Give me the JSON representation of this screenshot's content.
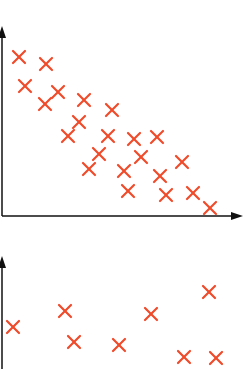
{
  "colors": {
    "marker": "#ef4a2a",
    "axis": "#111111",
    "background": "#ffffff"
  },
  "chart_data": [
    {
      "type": "scatter",
      "title": "",
      "xlabel": "",
      "ylabel": "",
      "grid": false,
      "legend": null,
      "marker": "x",
      "description": "Negative correlation scatter plot",
      "pixel_frame": {
        "x0": 2,
        "y0": 216,
        "x_end": 240,
        "y_top": 30
      },
      "points": [
        {
          "x": 19,
          "y": 57
        },
        {
          "x": 46,
          "y": 64
        },
        {
          "x": 25,
          "y": 86
        },
        {
          "x": 58,
          "y": 92
        },
        {
          "x": 45,
          "y": 104
        },
        {
          "x": 84,
          "y": 100
        },
        {
          "x": 112,
          "y": 110
        },
        {
          "x": 79,
          "y": 122
        },
        {
          "x": 68,
          "y": 136
        },
        {
          "x": 108,
          "y": 136
        },
        {
          "x": 134,
          "y": 139
        },
        {
          "x": 157,
          "y": 137
        },
        {
          "x": 99,
          "y": 154
        },
        {
          "x": 141,
          "y": 157
        },
        {
          "x": 89,
          "y": 169
        },
        {
          "x": 124,
          "y": 171
        },
        {
          "x": 160,
          "y": 176
        },
        {
          "x": 182,
          "y": 162
        },
        {
          "x": 128,
          "y": 191
        },
        {
          "x": 166,
          "y": 195
        },
        {
          "x": 193,
          "y": 193
        },
        {
          "x": 210,
          "y": 208
        }
      ]
    },
    {
      "type": "scatter",
      "title": "",
      "xlabel": "",
      "ylabel": "",
      "grid": false,
      "legend": null,
      "marker": "x",
      "description": "No clear correlation scatter plot (partially visible)",
      "pixel_frame": {
        "x0": 2,
        "y_top": 258
      },
      "points": [
        {
          "x": 13,
          "y": 327
        },
        {
          "x": 65,
          "y": 311
        },
        {
          "x": 74,
          "y": 342
        },
        {
          "x": 119,
          "y": 345
        },
        {
          "x": 151,
          "y": 314
        },
        {
          "x": 209,
          "y": 292
        },
        {
          "x": 184,
          "y": 357
        },
        {
          "x": 216,
          "y": 358
        }
      ]
    }
  ]
}
